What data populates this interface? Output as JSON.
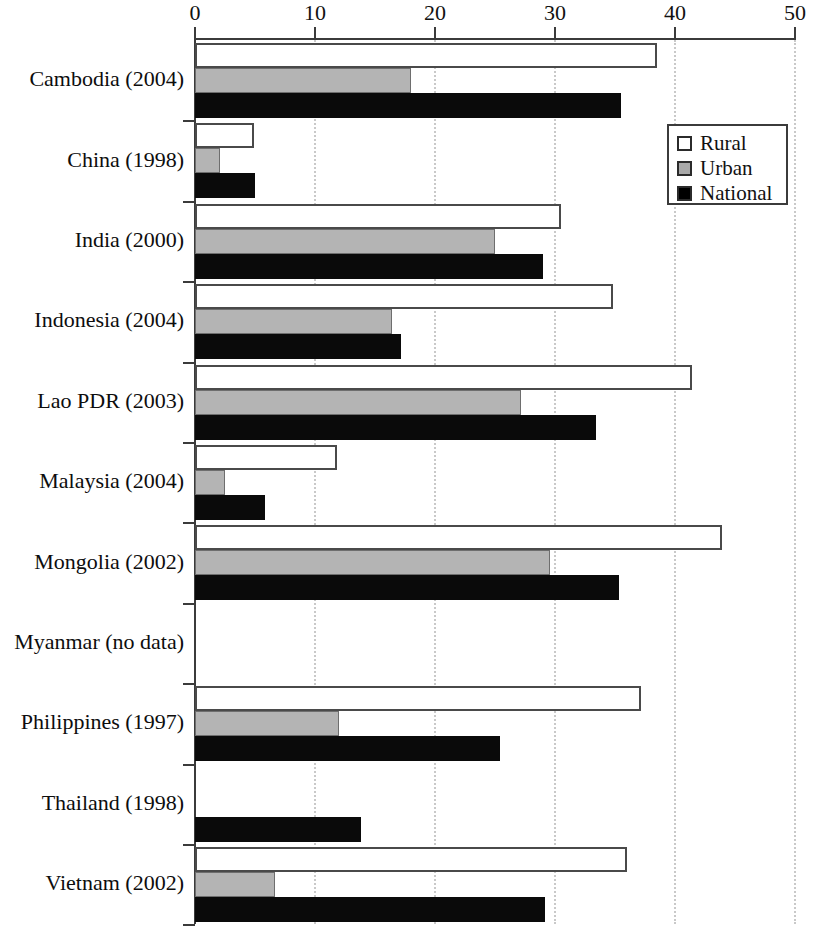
{
  "chart_data": {
    "type": "bar",
    "orientation": "horizontal",
    "title": "",
    "subtitle": "",
    "xlabel": "",
    "ylabel": "",
    "xlim": [
      0,
      50
    ],
    "ylim": null,
    "grid": "vertical dotted gridlines at every x tick",
    "legend_position": "upper right, inside plot area",
    "axis_position": "x-axis on top",
    "xticks": [
      0,
      10,
      20,
      30,
      40,
      50
    ],
    "xtick_labels": [
      "0",
      "10",
      "20",
      "30",
      "40",
      "50"
    ],
    "categories": [
      "Cambodia (2004)",
      "China (1998)",
      "India (2000)",
      "Indonesia (2004)",
      "Lao PDR (2003)",
      "Malaysia (2004)",
      "Mongolia (2002)",
      "Myanmar (no data)",
      "Philippines (1997)",
      "Thailand (1998)",
      "Vietnam (2002)"
    ],
    "series": [
      {
        "name": "Rural",
        "color": "#ffffff",
        "values": [
          38.5,
          4.9,
          30.5,
          34.8,
          41.4,
          11.8,
          43.9,
          null,
          37.2,
          null,
          36.0
        ]
      },
      {
        "name": "Urban",
        "color": "#b4b4b4",
        "values": [
          18.0,
          2.1,
          25.0,
          16.4,
          27.2,
          2.5,
          29.6,
          null,
          12.0,
          null,
          6.7
        ]
      },
      {
        "name": "National",
        "color": "#000000",
        "values": [
          35.5,
          5.0,
          29.0,
          17.2,
          33.4,
          5.8,
          35.3,
          null,
          25.4,
          13.8,
          29.2
        ]
      }
    ]
  },
  "legend": {
    "items": [
      {
        "label": "Rural",
        "swatch": "white-square-icon"
      },
      {
        "label": "Urban",
        "swatch": "gray-square-icon"
      },
      {
        "label": "National",
        "swatch": "black-square-icon"
      }
    ]
  }
}
